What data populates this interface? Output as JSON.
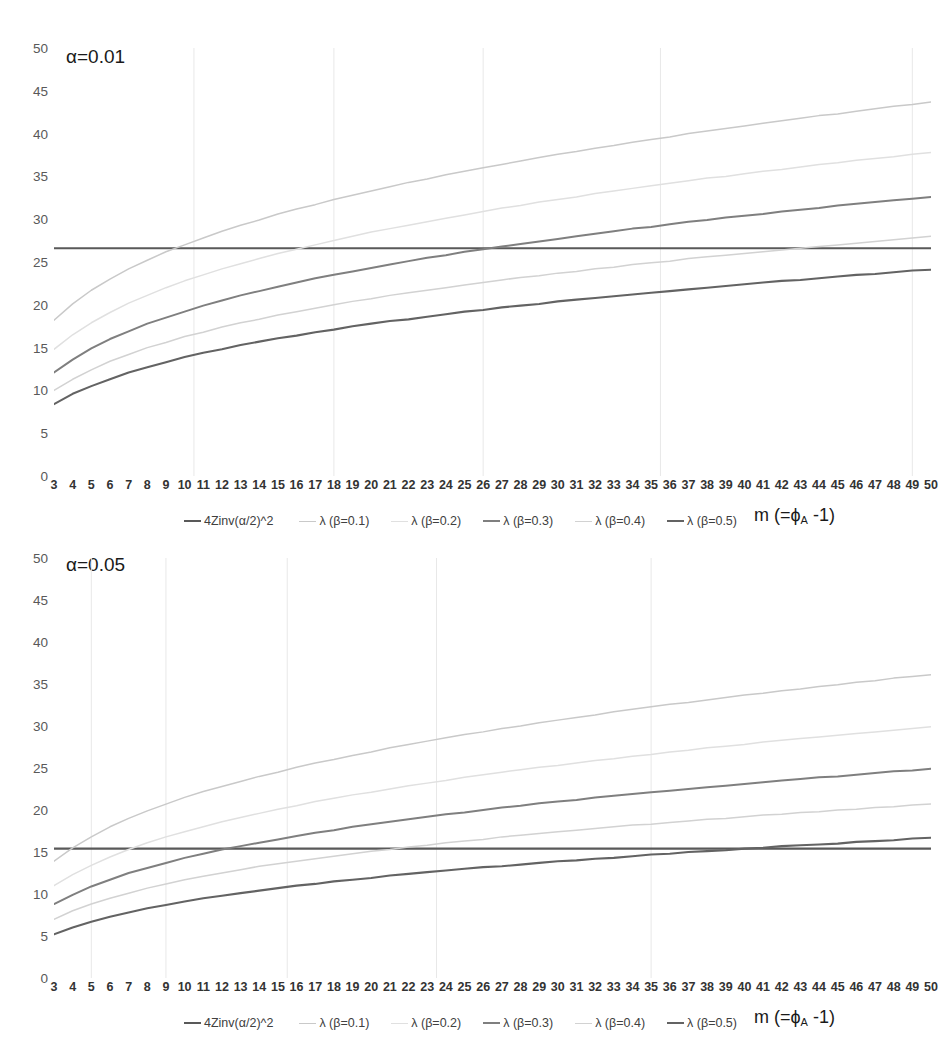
{
  "figure": {
    "width": 931,
    "height": 1064,
    "background": "#ffffff"
  },
  "series_styles": [
    {
      "key": "4Zinv",
      "color": "#595959",
      "width": 2.1
    },
    {
      "key": "b01",
      "color": "#c9c9c9",
      "width": 1.5
    },
    {
      "key": "b02",
      "color": "#e0e0e0",
      "width": 1.5
    },
    {
      "key": "b03",
      "color": "#7f7f7f",
      "width": 2.0
    },
    {
      "key": "b04",
      "color": "#d2d2d2",
      "width": 1.5
    },
    {
      "key": "b05",
      "color": "#636363",
      "width": 2.1
    }
  ],
  "gridline_color": "#e8e8e8",
  "axis_title": {
    "main": "m (=",
    "phi": "ϕ",
    "sub": "A",
    "tail": " -1)"
  },
  "charts": [
    {
      "id": "chart-alpha-001",
      "title": "α=0.01",
      "legend_labels": [
        "4Zinv(α/2)^2",
        "λ (β=0.1)",
        "λ (β=0.2)",
        "λ (β=0.3)",
        "λ (β=0.4)",
        "λ (β=0.5)"
      ],
      "gridlines_x": [
        10.5,
        18,
        26,
        35.5,
        49
      ],
      "chart_data": {
        "type": "line",
        "title": "α=0.01",
        "xlabel": "m (=ϕA -1)",
        "ylabel": "",
        "xlim": [
          3,
          50
        ],
        "ylim": [
          0,
          50
        ],
        "yticks": [
          0,
          5,
          10,
          15,
          20,
          25,
          30,
          35,
          40,
          45,
          50
        ],
        "grid": true,
        "legend_position": "bottom",
        "x": [
          3,
          4,
          5,
          6,
          7,
          8,
          9,
          10,
          11,
          12,
          13,
          14,
          15,
          16,
          17,
          18,
          19,
          20,
          21,
          22,
          23,
          24,
          25,
          26,
          27,
          28,
          29,
          30,
          31,
          32,
          33,
          34,
          35,
          36,
          37,
          38,
          39,
          40,
          41,
          42,
          43,
          44,
          45,
          46,
          47,
          48,
          49,
          50
        ],
        "series": [
          {
            "name": "4Zinv(α/2)^2",
            "color": "#595959",
            "values": [
              26.6,
              26.6,
              26.6,
              26.6,
              26.6,
              26.6,
              26.6,
              26.6,
              26.6,
              26.6,
              26.6,
              26.6,
              26.6,
              26.6,
              26.6,
              26.6,
              26.6,
              26.6,
              26.6,
              26.6,
              26.6,
              26.6,
              26.6,
              26.6,
              26.6,
              26.6,
              26.6,
              26.6,
              26.6,
              26.6,
              26.6,
              26.6,
              26.6,
              26.6,
              26.6,
              26.6,
              26.6,
              26.6,
              26.6,
              26.6,
              26.6,
              26.6,
              26.6,
              26.6,
              26.6,
              26.6,
              26.6,
              26.6
            ]
          },
          {
            "name": "λ (β=0.1)",
            "color": "#c9c9c9",
            "values": [
              18.2,
              20.1,
              21.7,
              23.0,
              24.2,
              25.2,
              26.2,
              27.0,
              27.8,
              28.6,
              29.3,
              29.9,
              30.6,
              31.2,
              31.7,
              32.3,
              32.8,
              33.3,
              33.8,
              34.3,
              34.7,
              35.2,
              35.6,
              36.0,
              36.4,
              36.8,
              37.2,
              37.6,
              37.9,
              38.3,
              38.6,
              39.0,
              39.3,
              39.6,
              40.0,
              40.3,
              40.6,
              40.9,
              41.2,
              41.5,
              41.8,
              42.1,
              42.3,
              42.6,
              42.9,
              43.2,
              43.4,
              43.7
            ]
          },
          {
            "name": "λ (β=0.2)",
            "color": "#e0e0e0",
            "values": [
              14.8,
              16.5,
              17.9,
              19.1,
              20.2,
              21.1,
              22.0,
              22.8,
              23.5,
              24.2,
              24.8,
              25.4,
              26.0,
              26.5,
              27.0,
              27.5,
              28.0,
              28.5,
              28.9,
              29.3,
              29.7,
              30.1,
              30.5,
              30.9,
              31.3,
              31.6,
              32.0,
              32.3,
              32.6,
              33.0,
              33.3,
              33.6,
              33.9,
              34.2,
              34.5,
              34.8,
              35.0,
              35.3,
              35.6,
              35.8,
              36.1,
              36.4,
              36.6,
              36.9,
              37.1,
              37.3,
              37.6,
              37.8
            ]
          },
          {
            "name": "λ (β=0.3)",
            "color": "#7f7f7f",
            "values": [
              12.1,
              13.6,
              14.9,
              16.0,
              16.9,
              17.8,
              18.5,
              19.2,
              19.9,
              20.5,
              21.1,
              21.6,
              22.1,
              22.6,
              23.1,
              23.5,
              23.9,
              24.3,
              24.7,
              25.1,
              25.5,
              25.8,
              26.2,
              26.5,
              26.8,
              27.1,
              27.4,
              27.7,
              28.0,
              28.3,
              28.6,
              28.9,
              29.1,
              29.4,
              29.7,
              29.9,
              30.2,
              30.4,
              30.6,
              30.9,
              31.1,
              31.3,
              31.6,
              31.8,
              32.0,
              32.2,
              32.4,
              32.6
            ]
          },
          {
            "name": "λ (β=0.4)",
            "color": "#d2d2d2",
            "values": [
              10.0,
              11.3,
              12.4,
              13.4,
              14.2,
              15.0,
              15.6,
              16.3,
              16.8,
              17.4,
              17.9,
              18.3,
              18.8,
              19.2,
              19.6,
              20.0,
              20.4,
              20.7,
              21.1,
              21.4,
              21.7,
              22.0,
              22.3,
              22.6,
              22.9,
              23.2,
              23.4,
              23.7,
              23.9,
              24.2,
              24.4,
              24.7,
              24.9,
              25.1,
              25.4,
              25.6,
              25.8,
              26.0,
              26.2,
              26.4,
              26.6,
              26.8,
              27.0,
              27.2,
              27.4,
              27.6,
              27.8,
              28.0
            ]
          },
          {
            "name": "λ (β=0.5)",
            "color": "#636363",
            "values": [
              8.4,
              9.6,
              10.5,
              11.3,
              12.1,
              12.7,
              13.3,
              13.9,
              14.4,
              14.8,
              15.3,
              15.7,
              16.1,
              16.4,
              16.8,
              17.1,
              17.5,
              17.8,
              18.1,
              18.3,
              18.6,
              18.9,
              19.2,
              19.4,
              19.7,
              19.9,
              20.1,
              20.4,
              20.6,
              20.8,
              21.0,
              21.2,
              21.4,
              21.6,
              21.8,
              22.0,
              22.2,
              22.4,
              22.6,
              22.8,
              22.9,
              23.1,
              23.3,
              23.5,
              23.6,
              23.8,
              24.0,
              24.1
            ]
          }
        ]
      }
    },
    {
      "id": "chart-alpha-005",
      "title": "α=0.05",
      "legend_labels": [
        "4Zinv(α/2)^2",
        "λ (β=0.1)",
        "λ (β=0.2)",
        "λ (β=0.3)",
        "λ (β=0.4)",
        "λ (β=0.5)"
      ],
      "gridlines_x": [
        5,
        9,
        15.5,
        23.5,
        35
      ],
      "chart_data": {
        "type": "line",
        "title": "α=0.05",
        "xlabel": "m (=ϕA -1)",
        "ylabel": "",
        "xlim": [
          3,
          50
        ],
        "ylim": [
          0,
          50
        ],
        "yticks": [
          0,
          5,
          10,
          15,
          20,
          25,
          30,
          35,
          40,
          45,
          50
        ],
        "grid": true,
        "legend_position": "bottom",
        "x": [
          3,
          4,
          5,
          6,
          7,
          8,
          9,
          10,
          11,
          12,
          13,
          14,
          15,
          16,
          17,
          18,
          19,
          20,
          21,
          22,
          23,
          24,
          25,
          26,
          27,
          28,
          29,
          30,
          31,
          32,
          33,
          34,
          35,
          36,
          37,
          38,
          39,
          40,
          41,
          42,
          43,
          44,
          45,
          46,
          47,
          48,
          49,
          50
        ],
        "series": [
          {
            "name": "4Zinv(α/2)^2",
            "color": "#595959",
            "values": [
              15.4,
              15.4,
              15.4,
              15.4,
              15.4,
              15.4,
              15.4,
              15.4,
              15.4,
              15.4,
              15.4,
              15.4,
              15.4,
              15.4,
              15.4,
              15.4,
              15.4,
              15.4,
              15.4,
              15.4,
              15.4,
              15.4,
              15.4,
              15.4,
              15.4,
              15.4,
              15.4,
              15.4,
              15.4,
              15.4,
              15.4,
              15.4,
              15.4,
              15.4,
              15.4,
              15.4,
              15.4,
              15.4,
              15.4,
              15.4,
              15.4,
              15.4,
              15.4,
              15.4,
              15.4,
              15.4,
              15.4,
              15.4
            ]
          },
          {
            "name": "λ (β=0.1)",
            "color": "#c9c9c9",
            "values": [
              13.9,
              15.5,
              16.8,
              18.0,
              19.0,
              19.9,
              20.7,
              21.5,
              22.2,
              22.8,
              23.4,
              24.0,
              24.5,
              25.1,
              25.6,
              26.0,
              26.5,
              26.9,
              27.4,
              27.8,
              28.2,
              28.6,
              29.0,
              29.3,
              29.7,
              30.0,
              30.4,
              30.7,
              31.0,
              31.3,
              31.7,
              32.0,
              32.3,
              32.6,
              32.8,
              33.1,
              33.4,
              33.7,
              33.9,
              34.2,
              34.4,
              34.7,
              34.9,
              35.2,
              35.4,
              35.7,
              35.9,
              36.1
            ]
          },
          {
            "name": "λ (β=0.2)",
            "color": "#e0e0e0",
            "values": [
              11.0,
              12.3,
              13.4,
              14.4,
              15.3,
              16.1,
              16.8,
              17.4,
              18.0,
              18.6,
              19.1,
              19.6,
              20.1,
              20.5,
              21.0,
              21.4,
              21.8,
              22.1,
              22.5,
              22.9,
              23.2,
              23.5,
              23.9,
              24.2,
              24.5,
              24.8,
              25.1,
              25.3,
              25.6,
              25.9,
              26.1,
              26.4,
              26.6,
              26.9,
              27.1,
              27.4,
              27.6,
              27.8,
              28.1,
              28.3,
              28.5,
              28.7,
              28.9,
              29.1,
              29.3,
              29.5,
              29.7,
              29.9
            ]
          },
          {
            "name": "λ (β=0.3)",
            "color": "#7f7f7f",
            "values": [
              8.8,
              9.9,
              10.9,
              11.7,
              12.5,
              13.1,
              13.7,
              14.3,
              14.8,
              15.3,
              15.7,
              16.1,
              16.5,
              16.9,
              17.3,
              17.6,
              18.0,
              18.3,
              18.6,
              18.9,
              19.2,
              19.5,
              19.7,
              20.0,
              20.3,
              20.5,
              20.8,
              21.0,
              21.2,
              21.5,
              21.7,
              21.9,
              22.1,
              22.3,
              22.5,
              22.7,
              22.9,
              23.1,
              23.3,
              23.5,
              23.7,
              23.9,
              24.0,
              24.2,
              24.4,
              24.6,
              24.7,
              24.9
            ]
          },
          {
            "name": "λ (β=0.4)",
            "color": "#d2d2d2",
            "values": [
              7.0,
              8.0,
              8.8,
              9.5,
              10.1,
              10.7,
              11.2,
              11.7,
              12.1,
              12.5,
              12.9,
              13.3,
              13.6,
              13.9,
              14.2,
              14.5,
              14.8,
              15.1,
              15.3,
              15.6,
              15.8,
              16.1,
              16.3,
              16.5,
              16.8,
              17.0,
              17.2,
              17.4,
              17.6,
              17.8,
              18.0,
              18.2,
              18.3,
              18.5,
              18.7,
              18.9,
              19.0,
              19.2,
              19.4,
              19.5,
              19.7,
              19.8,
              20.0,
              20.1,
              20.3,
              20.4,
              20.6,
              20.7
            ]
          },
          {
            "name": "λ (β=0.5)",
            "color": "#636363",
            "values": [
              5.2,
              6.0,
              6.7,
              7.3,
              7.8,
              8.3,
              8.7,
              9.1,
              9.5,
              9.8,
              10.1,
              10.4,
              10.7,
              11.0,
              11.2,
              11.5,
              11.7,
              11.9,
              12.2,
              12.4,
              12.6,
              12.8,
              13.0,
              13.2,
              13.3,
              13.5,
              13.7,
              13.9,
              14.0,
              14.2,
              14.3,
              14.5,
              14.7,
              14.8,
              15.0,
              15.1,
              15.2,
              15.4,
              15.5,
              15.7,
              15.8,
              15.9,
              16.0,
              16.2,
              16.3,
              16.4,
              16.6,
              16.7
            ]
          }
        ]
      }
    }
  ]
}
